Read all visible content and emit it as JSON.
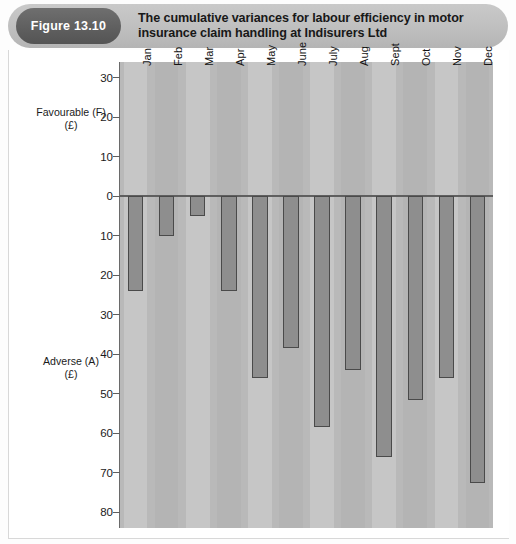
{
  "figure": {
    "badge": "Figure 13.10",
    "title": "The cumulative variances for labour efficiency in motor insurance claim handling at Indisurers Ltd"
  },
  "axis": {
    "favourable_label": "Favourable (F)",
    "favourable_unit": "(£)",
    "adverse_label": "Adverse (A)",
    "adverse_unit": "(£)"
  },
  "chart_data": {
    "type": "bar",
    "title": "The cumulative variances for labour efficiency in motor insurance claim handling at Indisurers Ltd",
    "xlabel": "",
    "ylabel": "Favourable (F) (£) / Adverse (A) (£)",
    "grid": false,
    "legend": "none",
    "ylim": [
      -84,
      34
    ],
    "y_ticks": [
      30,
      20,
      10,
      0,
      10,
      20,
      30,
      40,
      50,
      60,
      70,
      80
    ],
    "y_tick_values": [
      30,
      20,
      10,
      0,
      -10,
      -20,
      -30,
      -40,
      -50,
      -60,
      -70,
      -80
    ],
    "note": "All values are adverse (negative); axis is labelled with unsigned magnitudes, favourable above zero and adverse below zero.",
    "categories": [
      "Jan",
      "Feb",
      "Mar",
      "Apr",
      "May",
      "June",
      "July",
      "Aug",
      "Sept",
      "Oct",
      "Nov",
      "Dec"
    ],
    "values": [
      -24,
      -10,
      -5,
      -24,
      -46,
      -38.5,
      -58.5,
      -44,
      -66,
      -51.5,
      -46,
      -72.5
    ]
  }
}
